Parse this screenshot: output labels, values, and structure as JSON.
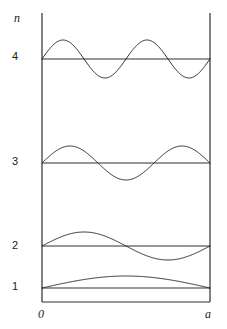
{
  "figure": {
    "title": "",
    "axis": {
      "y_axis_label": "n",
      "x_origin_label": "0",
      "x_end_label": "a"
    },
    "levels": [
      {
        "label": "1",
        "n": 1
      },
      {
        "label": "2",
        "n": 2
      },
      {
        "label": "3",
        "n": 3
      },
      {
        "label": "4",
        "n": 4
      }
    ],
    "colors": {
      "line": "#1a1a1a",
      "background": "#ffffff"
    }
  },
  "chart_data": {
    "type": "line",
    "title": "",
    "xlabel": "a",
    "ylabel": "n",
    "grid": false,
    "legend": false,
    "xlim": [
      0,
      1
    ],
    "x_tick_labels": [
      "0",
      "a"
    ],
    "x_tick_values": [
      0,
      1
    ],
    "y_tick_labels": [
      "1",
      "2",
      "3",
      "4"
    ],
    "y_tick_values": [
      288,
      246,
      163,
      59
    ],
    "box": {
      "x_left_px": 42,
      "x_right_px": 210,
      "y_top_px": 13,
      "y_bottom_px": 302
    },
    "series": [
      {
        "name": "n = 1",
        "n": 1,
        "baseline_y_px": 288,
        "amplitude_px": 12,
        "half_wavelengths": 1,
        "nodes": [
          0,
          1
        ],
        "x": [
          0,
          0.05,
          0.1,
          0.15,
          0.2,
          0.25,
          0.3,
          0.35,
          0.4,
          0.45,
          0.5,
          0.55,
          0.6,
          0.65,
          0.7,
          0.75,
          0.8,
          0.85,
          0.9,
          0.95,
          1
        ],
        "y": [
          0,
          0.156,
          0.309,
          0.454,
          0.588,
          0.707,
          0.809,
          0.891,
          0.951,
          0.988,
          1,
          0.988,
          0.951,
          0.891,
          0.809,
          0.707,
          0.588,
          0.454,
          0.309,
          0.156,
          0
        ]
      },
      {
        "name": "n = 2",
        "n": 2,
        "baseline_y_px": 246,
        "amplitude_px": 14,
        "half_wavelengths": 2,
        "nodes": [
          0,
          0.5,
          1
        ],
        "x": [
          0,
          0.05,
          0.1,
          0.15,
          0.2,
          0.25,
          0.3,
          0.35,
          0.4,
          0.45,
          0.5,
          0.55,
          0.6,
          0.65,
          0.7,
          0.75,
          0.8,
          0.85,
          0.9,
          0.95,
          1
        ],
        "y": [
          0,
          0.309,
          0.588,
          0.809,
          0.951,
          1,
          0.951,
          0.809,
          0.588,
          0.309,
          0,
          -0.309,
          -0.588,
          -0.809,
          -0.951,
          -1,
          -0.951,
          -0.809,
          -0.588,
          -0.309,
          0
        ]
      },
      {
        "name": "n = 3",
        "n": 3,
        "baseline_y_px": 163,
        "amplitude_px": 17,
        "half_wavelengths": 3,
        "nodes": [
          0,
          0.3333,
          0.6667,
          1
        ],
        "x": [
          0,
          0.05,
          0.1,
          0.15,
          0.2,
          0.25,
          0.3,
          0.35,
          0.4,
          0.45,
          0.5,
          0.55,
          0.6,
          0.65,
          0.7,
          0.75,
          0.8,
          0.85,
          0.9,
          0.95,
          1
        ],
        "y": [
          0,
          0.454,
          0.809,
          0.988,
          0.951,
          0.707,
          0.309,
          -0.156,
          -0.588,
          -0.891,
          -1,
          -0.891,
          -0.588,
          -0.156,
          0.309,
          0.707,
          0.951,
          0.988,
          0.809,
          0.454,
          0
        ]
      },
      {
        "name": "n = 4",
        "n": 4,
        "baseline_y_px": 59,
        "amplitude_px": 19,
        "half_wavelengths": 4,
        "nodes": [
          0,
          0.25,
          0.5,
          0.75,
          1
        ],
        "x": [
          0,
          0.05,
          0.1,
          0.15,
          0.2,
          0.25,
          0.3,
          0.35,
          0.4,
          0.45,
          0.5,
          0.55,
          0.6,
          0.65,
          0.7,
          0.75,
          0.8,
          0.85,
          0.9,
          0.95,
          1
        ],
        "y": [
          0,
          0.588,
          0.951,
          0.951,
          0.588,
          0,
          -0.588,
          -0.951,
          -0.951,
          -0.588,
          0,
          0.588,
          0.951,
          0.951,
          0.588,
          0,
          -0.588,
          -0.951,
          -0.951,
          -0.588,
          0
        ]
      }
    ]
  }
}
